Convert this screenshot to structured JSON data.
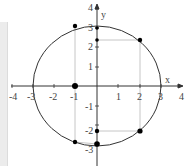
{
  "diagram": {
    "type": "coordinate-plane-circle",
    "axes": {
      "x_label": "x",
      "y_label": "y",
      "x_ticks": [
        "-4",
        "-3",
        "-2",
        "-1",
        "1",
        "2",
        "3",
        "4"
      ],
      "y_ticks": [
        "4",
        "3",
        "2",
        "1",
        "-1",
        "-2",
        "-3"
      ]
    },
    "circle": {
      "center": [
        0,
        0
      ],
      "radius": 3
    },
    "points": [
      {
        "x": -1,
        "y": 2.83
      },
      {
        "x": 0,
        "y": 2.9
      },
      {
        "x": 0,
        "y": 2.24
      },
      {
        "x": 2,
        "y": 2.24
      },
      {
        "x": -1,
        "y": 0
      },
      {
        "x": 0,
        "y": -2.0
      },
      {
        "x": 2,
        "y": -2.0
      },
      {
        "x": -1,
        "y": -2.83
      },
      {
        "x": 0,
        "y": -2.9
      }
    ],
    "colors": {
      "axis": "#333333",
      "circle": "#333333",
      "guide": "#b0b0b0",
      "point": "#000000"
    }
  }
}
